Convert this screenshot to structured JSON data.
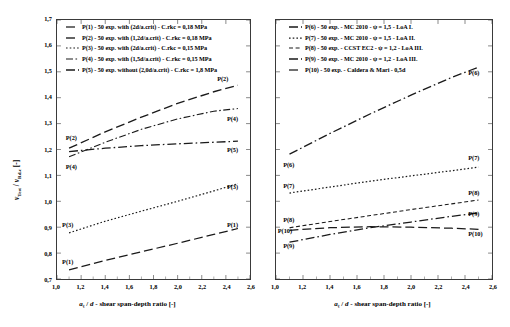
{
  "figure": {
    "width": 510,
    "height": 327,
    "background": "#ffffff",
    "line_color": "#1a1a1a",
    "frame_color": "#3a3a3a"
  },
  "chart_data": [
    {
      "type": "line",
      "panel": "left",
      "title": "",
      "xlabel": "aₖ / d - shear span-depth ratio [-]",
      "ylabel": "v_Test / v_Rd,c [-]",
      "xlim": [
        1.0,
        2.6
      ],
      "ylim": [
        0.7,
        1.7
      ],
      "xticks": [
        1.0,
        1.2,
        1.4,
        1.6,
        1.8,
        2.0,
        2.2,
        2.4,
        2.6
      ],
      "xtick_labels": [
        "1,0",
        "1,2",
        "1,4",
        "1,6",
        "1,8",
        "2,0",
        "2,2",
        "2,4",
        "2,6"
      ],
      "yticks": [
        0.7,
        0.8,
        0.9,
        1.0,
        1.1,
        1.2,
        1.3,
        1.4,
        1.5,
        1.6,
        1.7
      ],
      "ytick_labels": [
        "0,7",
        "0,8",
        "0,9",
        "1,0",
        "1,1",
        "1,2",
        "1,3",
        "1,4",
        "1,5",
        "1,6",
        "1,7"
      ],
      "grid": false,
      "legend_position": "upper-left-inside",
      "series": [
        {
          "name": "P(1)",
          "legend": "P(1) - 50 exp. with (2d/a.crit) - C.rkc = 0,18 MPa",
          "dash": "9,4",
          "width": 1.25,
          "x": [
            1.1,
            1.4,
            1.7,
            2.0,
            2.3,
            2.5
          ],
          "values": [
            0.735,
            0.772,
            0.805,
            0.838,
            0.872,
            0.895
          ]
        },
        {
          "name": "P(2)",
          "legend": "P(2) - 50 exp. with (1,2d/a.crit) - C.rkc = 0,18 MPa",
          "dash": "9,4",
          "width": 1.35,
          "x": [
            1.1,
            1.4,
            1.7,
            2.0,
            2.3,
            2.5
          ],
          "values": [
            1.205,
            1.268,
            1.325,
            1.378,
            1.423,
            1.448
          ]
        },
        {
          "name": "P(3)",
          "legend": "P(3) - 50 exp. with (2d/a.crit) - C.rkc = 0,15 MPa",
          "dash": "1.6,2.1",
          "width": 1.2,
          "x": [
            1.1,
            1.4,
            1.7,
            2.0,
            2.3,
            2.5
          ],
          "values": [
            0.878,
            0.923,
            0.962,
            1.0,
            1.04,
            1.068
          ]
        },
        {
          "name": "P(4)",
          "legend": "P(4) - 50 exp. with (1,5d/a.crit) - C.rkc = 0,15 MPa",
          "dash": "7,2.5,1.6,2.5",
          "width": 1.1,
          "x": [
            1.1,
            1.4,
            1.7,
            2.0,
            2.3,
            2.5
          ],
          "values": [
            1.172,
            1.228,
            1.278,
            1.318,
            1.348,
            1.358
          ]
        },
        {
          "name": "P(5)",
          "legend": "P(5) - 50 exp. without (2,0d/a.crit) - C.rkc = 1,8 MPa",
          "dash": "9,3,1.6,3",
          "width": 1.3,
          "x": [
            1.1,
            1.4,
            1.7,
            2.0,
            2.3,
            2.5
          ],
          "values": [
            1.192,
            1.205,
            1.215,
            1.222,
            1.228,
            1.232
          ]
        }
      ],
      "annotations": [
        {
          "text": "P(2)",
          "x": 1.08,
          "y": 1.245,
          "anchor": "left"
        },
        {
          "text": "P(4)",
          "x": 1.08,
          "y": 1.132,
          "anchor": "left"
        },
        {
          "text": "P(3)",
          "x": 1.05,
          "y": 0.912,
          "anchor": "left"
        },
        {
          "text": "P(1)",
          "x": 1.05,
          "y": 0.768,
          "anchor": "left"
        },
        {
          "text": "P(2)",
          "x": 2.47,
          "y": 1.472,
          "anchor": "right"
        },
        {
          "text": "P(4)",
          "x": 2.55,
          "y": 1.318,
          "anchor": "right"
        },
        {
          "text": "P(5)",
          "x": 2.55,
          "y": 1.198,
          "anchor": "right"
        },
        {
          "text": "P(3)",
          "x": 2.55,
          "y": 1.058,
          "anchor": "right"
        },
        {
          "text": "P(1)",
          "x": 2.55,
          "y": 0.912,
          "anchor": "right"
        }
      ]
    },
    {
      "type": "line",
      "panel": "right",
      "title": "",
      "xlabel": "aₖ / d - shear span-depth ratio [-]",
      "ylabel": "",
      "xlim": [
        1.0,
        2.6
      ],
      "ylim": [
        0.7,
        1.7
      ],
      "xticks": [
        1.0,
        1.2,
        1.4,
        1.6,
        1.8,
        2.0,
        2.2,
        2.4,
        2.6
      ],
      "xtick_labels": [
        "1,0",
        "1,2",
        "1,4",
        "1,6",
        "1,8",
        "2,0",
        "2,2",
        "2,4",
        "2,6"
      ],
      "yticks": [
        0.7,
        0.8,
        0.9,
        1.0,
        1.1,
        1.2,
        1.3,
        1.4,
        1.5,
        1.6,
        1.7
      ],
      "ytick_labels": [],
      "grid": false,
      "legend_position": "upper-center-inside",
      "series": [
        {
          "name": "P(6)",
          "legend": "P(6) - 50 exp. - MC 2010 - ψ = 1,5 - LoA I.",
          "dash": "9,3,1.6,3",
          "width": 1.3,
          "x": [
            1.1,
            1.4,
            1.7,
            2.0,
            2.3,
            2.5
          ],
          "values": [
            1.182,
            1.262,
            1.338,
            1.41,
            1.478,
            1.518
          ]
        },
        {
          "name": "P(7)",
          "legend": "P(7) - 50 exp. - MC 2010 - ψ = 1,5 - LoA II.",
          "dash": "1.6,2.1",
          "width": 1.25,
          "x": [
            1.1,
            1.4,
            1.7,
            2.0,
            2.3,
            2.5
          ],
          "values": [
            1.032,
            1.055,
            1.078,
            1.098,
            1.118,
            1.132
          ]
        },
        {
          "name": "P(8)",
          "legend": "P(8) - 50 exp. - CCST EC2 - ψ = 1,2 - LoA III.",
          "dash": "4,2.6",
          "width": 1.05,
          "x": [
            1.1,
            1.4,
            1.7,
            2.0,
            2.3,
            2.5
          ],
          "values": [
            0.898,
            0.922,
            0.945,
            0.968,
            0.99,
            1.005
          ]
        },
        {
          "name": "P(9)",
          "legend": "P(9) - 50 exp. - MC 2010 - ψ = 1,2 - LoA III.",
          "dash": "9,3,1.6,3",
          "width": 1.3,
          "x": [
            1.1,
            1.4,
            1.7,
            2.0,
            2.3,
            2.5
          ],
          "values": [
            0.842,
            0.872,
            0.898,
            0.92,
            0.942,
            0.955
          ]
        },
        {
          "name": "P(10)",
          "legend": "P(10) - 50 exp. - Caldera & Mari - 0,5d",
          "dash": "9,4",
          "width": 1.25,
          "x": [
            1.1,
            1.4,
            1.7,
            2.0,
            2.3,
            2.5
          ],
          "values": [
            0.888,
            0.898,
            0.902,
            0.9,
            0.896,
            0.892
          ]
        }
      ],
      "annotations": [
        {
          "text": "P(6)",
          "x": 1.06,
          "y": 1.142,
          "anchor": "left"
        },
        {
          "text": "P(7)",
          "x": 1.06,
          "y": 1.062,
          "anchor": "left"
        },
        {
          "text": "P(8)",
          "x": 1.06,
          "y": 0.928,
          "anchor": "left"
        },
        {
          "text": "P(10)",
          "x": 1.02,
          "y": 0.888,
          "anchor": "left"
        },
        {
          "text": "P(9)",
          "x": 1.06,
          "y": 0.832,
          "anchor": "left"
        },
        {
          "text": "P(6)",
          "x": 2.55,
          "y": 1.492,
          "anchor": "right"
        },
        {
          "text": "P(7)",
          "x": 2.55,
          "y": 1.168,
          "anchor": "right"
        },
        {
          "text": "P(8)",
          "x": 2.55,
          "y": 1.032,
          "anchor": "right"
        },
        {
          "text": "P(9)",
          "x": 2.55,
          "y": 0.952,
          "anchor": "right"
        },
        {
          "text": "P(10)",
          "x": 2.55,
          "y": 0.878,
          "anchor": "right"
        }
      ]
    }
  ],
  "left_panel": {
    "yaxis_title_parts": {
      "v1": "v",
      "sub1": "Test",
      "slash": " / ",
      "v2": "v",
      "sub2": "Rd,c",
      "unit": " [-]"
    },
    "xaxis_title": "aₖ / d - shear span-depth ratio [-]"
  },
  "right_panel": {
    "xaxis_title": "aₖ / d - shear span-depth ratio [-]"
  }
}
